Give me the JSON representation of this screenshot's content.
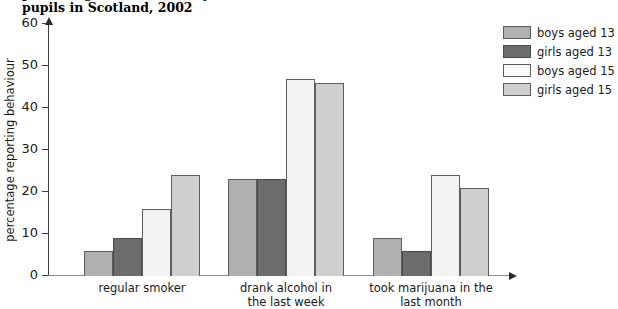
{
  "chart_data": {
    "type": "bar",
    "title": "percentage of 13- and 15-year-old\npupils in Scotland, 2002",
    "title_visible_text": "pupils in Scotland, 2002",
    "xlabel": "",
    "ylabel": "percentage reporting behaviour",
    "ylim": [
      0,
      60
    ],
    "ytick_step": 10,
    "yticks": [
      0,
      10,
      20,
      30,
      40,
      50,
      60
    ],
    "ytick_labels": [
      "0",
      "10",
      "20",
      "30",
      "40",
      "50",
      "60"
    ],
    "grid": false,
    "legend_position": "top-right",
    "categories": [
      "regular smoker",
      "drank alcohol in\nthe last week",
      "took marijuana in the\nlast month"
    ],
    "series": [
      {
        "name": "boys aged 13",
        "color": "#b0b0b0",
        "values": [
          6,
          23,
          9
        ]
      },
      {
        "name": "girls aged 13",
        "color": "#6d6d6d",
        "values": [
          9,
          23,
          6
        ]
      },
      {
        "name": "boys aged 15",
        "color": "#f2f2f2",
        "values": [
          16,
          47,
          24
        ]
      },
      {
        "name": "girls aged 15",
        "color": "#cfcfcf",
        "values": [
          24,
          46,
          21
        ]
      }
    ]
  },
  "axes": {
    "y_axis_arrow": "arrow-up-icon",
    "x_axis_arrow": "arrow-right-icon"
  }
}
